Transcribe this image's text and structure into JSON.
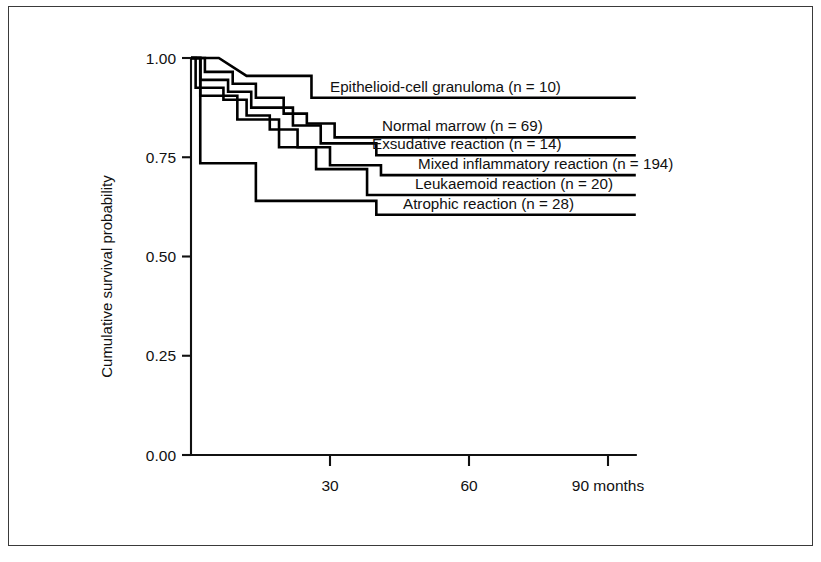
{
  "figure": {
    "background": "#ffffff",
    "ink_color": "#000000",
    "border_color": "#3a3a3a"
  },
  "chart_data": {
    "type": "line",
    "subtype": "kaplan-meier-step",
    "title": "",
    "xlabel": "months",
    "ylabel": "Cumulative survival probability",
    "xlim": [
      0,
      96
    ],
    "ylim": [
      0,
      1
    ],
    "grid": false,
    "legend_position": "inline-right-of-curve",
    "x_ticks": [
      30,
      60,
      90
    ],
    "x_tick_labels": [
      "30",
      "60",
      "90 months"
    ],
    "y_ticks": [
      0.0,
      0.25,
      0.5,
      0.75,
      1.0
    ],
    "y_tick_labels": [
      "0.00",
      "0.25",
      "0.50",
      "0.75",
      "1.00"
    ],
    "series": [
      {
        "name": "Epithelioid-cell granuloma",
        "n": 10,
        "label": "Epithelioid-cell granuloma (n = 10)",
        "label_x": 71,
        "label_y": 0.925,
        "leader_end_x": 96,
        "steps": [
          {
            "t": 0,
            "s": 1.0
          },
          {
            "t": 6,
            "s": 1.0
          },
          {
            "t": 12,
            "s": 0.955
          },
          {
            "t": 26,
            "s": 0.955
          },
          {
            "t": 26,
            "s": 0.9
          },
          {
            "t": 96,
            "s": 0.9
          }
        ]
      },
      {
        "name": "Normal marrow",
        "n": 69,
        "label": "Normal marrow (n = 69)",
        "label_x": 82,
        "label_y": 0.805,
        "leader_end_x": 96,
        "steps": [
          {
            "t": 0,
            "s": 1.0
          },
          {
            "t": 3,
            "s": 1.0
          },
          {
            "t": 3,
            "s": 0.965
          },
          {
            "t": 9,
            "s": 0.965
          },
          {
            "t": 9,
            "s": 0.935
          },
          {
            "t": 14,
            "s": 0.935
          },
          {
            "t": 14,
            "s": 0.9
          },
          {
            "t": 20,
            "s": 0.9
          },
          {
            "t": 20,
            "s": 0.86
          },
          {
            "t": 25,
            "s": 0.86
          },
          {
            "t": 25,
            "s": 0.835
          },
          {
            "t": 31,
            "s": 0.835
          },
          {
            "t": 31,
            "s": 0.8
          },
          {
            "t": 96,
            "s": 0.8
          }
        ]
      },
      {
        "name": "Exsudative reaction",
        "n": 14,
        "label": "Exsudative reaction (n = 14)",
        "label_x": 78,
        "label_y": 0.755,
        "leader_end_x": 96,
        "steps": [
          {
            "t": 0,
            "s": 1.0
          },
          {
            "t": 2,
            "s": 1.0
          },
          {
            "t": 2,
            "s": 0.945
          },
          {
            "t": 8,
            "s": 0.945
          },
          {
            "t": 8,
            "s": 0.915
          },
          {
            "t": 13,
            "s": 0.915
          },
          {
            "t": 13,
            "s": 0.875
          },
          {
            "t": 22,
            "s": 0.875
          },
          {
            "t": 22,
            "s": 0.83
          },
          {
            "t": 28,
            "s": 0.83
          },
          {
            "t": 28,
            "s": 0.785
          },
          {
            "t": 40,
            "s": 0.785
          },
          {
            "t": 40,
            "s": 0.755
          },
          {
            "t": 96,
            "s": 0.755
          }
        ]
      },
      {
        "name": "Mixed inflammatory reaction",
        "n": 194,
        "label": "Mixed inflammatory reaction (n = 194)",
        "label_x": 72,
        "label_y": 0.705,
        "leader_end_x": 96,
        "steps": [
          {
            "t": 0,
            "s": 1.0
          },
          {
            "t": 1,
            "s": 1.0
          },
          {
            "t": 1,
            "s": 0.925
          },
          {
            "t": 7,
            "s": 0.925
          },
          {
            "t": 7,
            "s": 0.895
          },
          {
            "t": 12,
            "s": 0.895
          },
          {
            "t": 12,
            "s": 0.855
          },
          {
            "t": 17,
            "s": 0.855
          },
          {
            "t": 17,
            "s": 0.82
          },
          {
            "t": 23,
            "s": 0.82
          },
          {
            "t": 23,
            "s": 0.775
          },
          {
            "t": 30,
            "s": 0.775
          },
          {
            "t": 30,
            "s": 0.73
          },
          {
            "t": 41,
            "s": 0.73
          },
          {
            "t": 41,
            "s": 0.705
          },
          {
            "t": 96,
            "s": 0.705
          }
        ]
      },
      {
        "name": "Leukaemoid reaction",
        "n": 20,
        "label": "Leukaemoid reaction (n = 20)",
        "label_x": 77,
        "label_y": 0.655,
        "leader_end_x": 96,
        "steps": [
          {
            "t": 0,
            "s": 1.0
          },
          {
            "t": 2,
            "s": 1.0
          },
          {
            "t": 2,
            "s": 0.905
          },
          {
            "t": 10,
            "s": 0.905
          },
          {
            "t": 10,
            "s": 0.845
          },
          {
            "t": 19,
            "s": 0.845
          },
          {
            "t": 19,
            "s": 0.775
          },
          {
            "t": 27,
            "s": 0.775
          },
          {
            "t": 27,
            "s": 0.72
          },
          {
            "t": 38,
            "s": 0.72
          },
          {
            "t": 38,
            "s": 0.655
          },
          {
            "t": 96,
            "s": 0.655
          }
        ]
      },
      {
        "name": "Atrophic reaction",
        "n": 28,
        "label": "Atrophic reaction (n = 28)",
        "label_x": 70,
        "label_y": 0.605,
        "leader_end_x": 96,
        "steps": [
          {
            "t": 0,
            "s": 1.0
          },
          {
            "t": 2,
            "s": 1.0
          },
          {
            "t": 2,
            "s": 0.735
          },
          {
            "t": 14,
            "s": 0.735
          },
          {
            "t": 14,
            "s": 0.64
          },
          {
            "t": 40,
            "s": 0.64
          },
          {
            "t": 40,
            "s": 0.605
          },
          {
            "t": 96,
            "s": 0.605
          }
        ]
      }
    ]
  }
}
